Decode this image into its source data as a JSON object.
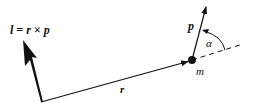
{
  "diagram": {
    "labels": {
      "angular_momentum": "l = r × p",
      "position": "r",
      "momentum": "p",
      "mass": "m",
      "angle": "α"
    },
    "colors": {
      "ink": "#111111",
      "background": "#ffffff"
    },
    "geometry": {
      "origin": [
        41,
        102
      ],
      "l_tip": [
        23,
        40
      ],
      "mass_point": [
        192,
        60
      ],
      "p_tip": [
        206,
        6
      ],
      "dashed_end": [
        242,
        44
      ]
    }
  }
}
